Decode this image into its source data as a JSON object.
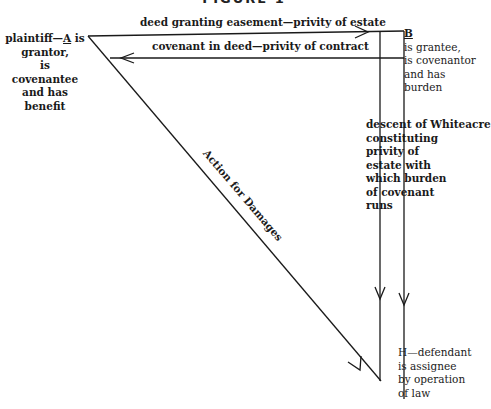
{
  "figure": {
    "title": "FIGURE 1"
  },
  "nodes": {
    "A": {
      "line1_prefix": "plaintiff—",
      "letter": "A",
      "line1_suffix": " is",
      "lines": [
        "grantor,",
        "is",
        "covenantee",
        "and has",
        "benefit"
      ]
    },
    "B": {
      "letter": "B",
      "lines": [
        "is grantee,",
        "is covenantor",
        "and has",
        "burden"
      ]
    },
    "H": {
      "lines": [
        "H—defendant",
        "is assignee",
        "by operation",
        "of law"
      ]
    }
  },
  "edges": {
    "deed": {
      "label": "deed granting easement—privity of estate"
    },
    "covenant": {
      "label": "covenant in deed—privity of contract"
    },
    "action": {
      "label": "Action for Damages"
    },
    "descent": {
      "lines": [
        "descent of Whiteacre",
        "constituting",
        "privity of",
        "estate with",
        "which burden",
        "of covenant",
        "runs"
      ]
    }
  },
  "colors": {
    "ink": "#1a1a1a",
    "background": "#ffffff"
  }
}
